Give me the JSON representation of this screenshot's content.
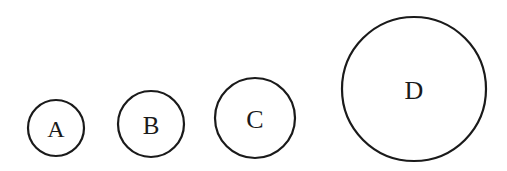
{
  "diagram": {
    "type": "circles-increasing-size",
    "circles": [
      {
        "label": "A",
        "cx": 56,
        "cy": 128,
        "r": 28,
        "font_size": 24
      },
      {
        "label": "B",
        "cx": 151,
        "cy": 124,
        "r": 33,
        "font_size": 25
      },
      {
        "label": "C",
        "cx": 255,
        "cy": 118,
        "r": 40,
        "font_size": 26
      },
      {
        "label": "D",
        "cx": 414,
        "cy": 89,
        "r": 72,
        "font_size": 26
      }
    ],
    "stroke_color": "#1a1a1a",
    "background": "#ffffff"
  }
}
